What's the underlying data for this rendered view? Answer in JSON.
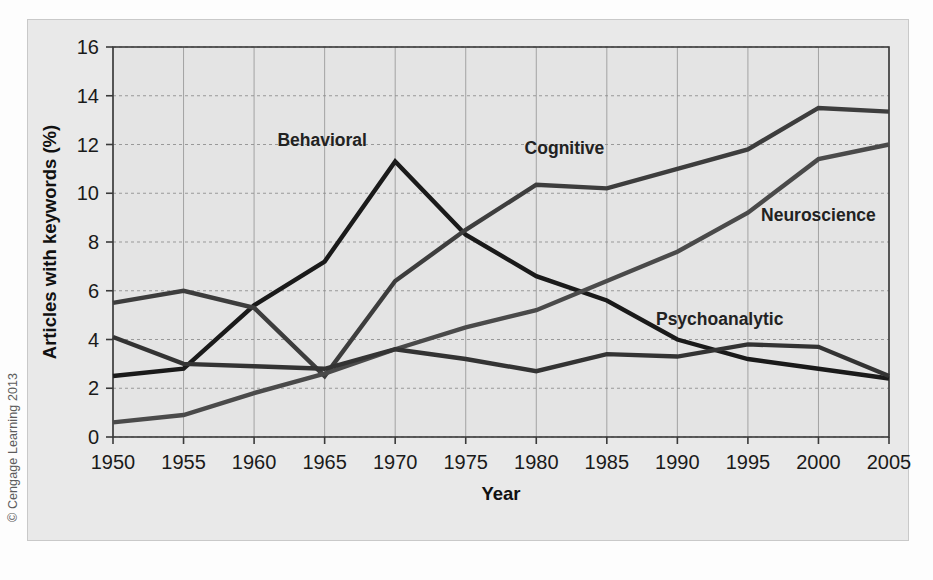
{
  "figure": {
    "credit": "© Cengage Learning 2013",
    "background_color": "#e9e9e9",
    "plot_background_color": "#e4e4e4"
  },
  "chart_data": {
    "type": "line",
    "title": "",
    "xlabel": "Year",
    "ylabel": "Articles with keywords (%)",
    "x": [
      1950,
      1955,
      1960,
      1965,
      1970,
      1975,
      1980,
      1985,
      1990,
      1995,
      2000,
      2005
    ],
    "xtick_labels": [
      "1950",
      "1955",
      "1960",
      "1965",
      "1970",
      "1975",
      "1980",
      "1985",
      "1990",
      "1995",
      "2000",
      "2005"
    ],
    "ytick_labels": [
      "0",
      "2",
      "4",
      "6",
      "8",
      "10",
      "12",
      "14",
      "16"
    ],
    "yticks": [
      0,
      2,
      4,
      6,
      8,
      10,
      12,
      14,
      16
    ],
    "xlim": [
      1950,
      2005
    ],
    "ylim": [
      0,
      16
    ],
    "grid": true,
    "legend_position": "inline-labels",
    "series": [
      {
        "name": "Behavioral",
        "color": "#1a1a1a",
        "width": 4.4,
        "label_x": 1968,
        "label_y": 11.95,
        "label_anchor": "end",
        "values": [
          2.5,
          2.8,
          5.4,
          7.2,
          11.3,
          8.3,
          6.6,
          5.6,
          4.0,
          3.2,
          2.8,
          2.4
        ]
      },
      {
        "name": "Cognitive",
        "color": "#3d3d3d",
        "width": 4.4,
        "label_x": 1982,
        "label_y": 11.6,
        "label_anchor": "middle",
        "values": [
          5.5,
          6.0,
          5.3,
          2.5,
          6.4,
          8.5,
          10.35,
          10.2,
          11.0,
          11.8,
          13.5,
          13.35
        ]
      },
      {
        "name": "Neuroscience",
        "color": "#4a4a4a",
        "width": 4.4,
        "label_x": 2000,
        "label_y": 8.85,
        "label_anchor": "middle",
        "values": [
          0.6,
          0.9,
          1.8,
          2.6,
          3.6,
          4.5,
          5.2,
          6.4,
          7.6,
          9.2,
          11.4,
          12.0
        ]
      },
      {
        "name": "Psychoanalytic",
        "color": "#333333",
        "width": 4.4,
        "label_x": 1993,
        "label_y": 4.6,
        "label_anchor": "middle",
        "values": [
          4.1,
          3.0,
          2.9,
          2.8,
          3.6,
          3.2,
          2.7,
          3.4,
          3.3,
          3.8,
          3.7,
          2.5
        ]
      }
    ]
  }
}
